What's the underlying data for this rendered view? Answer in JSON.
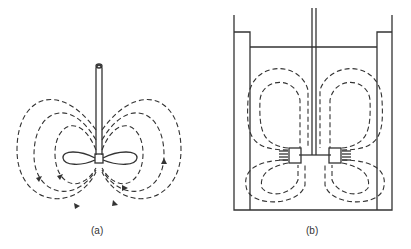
{
  "figure": {
    "panels": [
      {
        "id": "a",
        "label": "(a)",
        "description": "Propeller impeller with axial flow circulation loops"
      },
      {
        "id": "b",
        "label": "(b)",
        "description": "Baffled tank with radial flow turbine impeller, upper and lower circulation loops"
      }
    ],
    "colors": {
      "line": "#333333",
      "background": "#ffffff"
    }
  }
}
